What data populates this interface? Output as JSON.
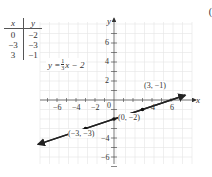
{
  "panel_label": "(",
  "table": {
    "headers": [
      "x",
      "y"
    ],
    "rows": [
      [
        "0",
        "−2"
      ],
      [
        "−3",
        "−3"
      ],
      [
        "3",
        "−1"
      ]
    ]
  },
  "equation": {
    "lhs": "y = ",
    "num": "1",
    "den": "3",
    "rhs": "x − 2"
  },
  "axes": {
    "x_label": "x",
    "y_label": "y",
    "origin_label": "0",
    "x_ticks": [
      "−6",
      "−4",
      "−2",
      "2",
      "4",
      "6"
    ],
    "y_ticks": [
      "6",
      "4",
      "2",
      "−2",
      "−4",
      "−6"
    ]
  },
  "points": [
    {
      "label": "(3, −1)",
      "x": 3,
      "y": -1
    },
    {
      "label": "(0, −2)",
      "x": 0,
      "y": -2
    },
    {
      "label": "(−3, −3)",
      "x": -3,
      "y": -3
    }
  ],
  "chart_data": {
    "type": "line",
    "title": "",
    "equation": "y = (1/3)x − 2",
    "xlabel": "x",
    "ylabel": "y",
    "xlim": [
      -8,
      8
    ],
    "ylim": [
      -7,
      8
    ],
    "grid": true,
    "x_ticks": [
      -6,
      -4,
      -2,
      2,
      4,
      6
    ],
    "y_ticks": [
      -6,
      -4,
      -2,
      2,
      4,
      6
    ],
    "series": [
      {
        "name": "y = (1/3)x − 2",
        "x": [
          -8,
          7.5
        ],
        "y": [
          -4.67,
          0.5
        ]
      }
    ],
    "points": [
      {
        "x": 0,
        "y": -2,
        "label": "(0, −2)"
      },
      {
        "x": -3,
        "y": -3,
        "label": "(−3, −3)"
      },
      {
        "x": 3,
        "y": -1,
        "label": "(3, −1)"
      }
    ],
    "table": {
      "columns": [
        "x",
        "y"
      ],
      "rows": [
        [
          0,
          -2
        ],
        [
          -3,
          -3
        ],
        [
          3,
          -1
        ]
      ]
    }
  }
}
